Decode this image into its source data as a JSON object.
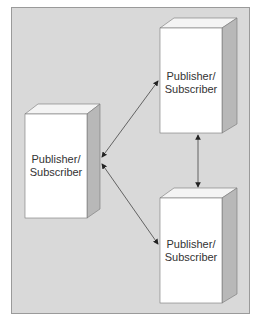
{
  "diagram": {
    "nodes": [
      {
        "id": "left",
        "label_line1": "Publisher/",
        "label_line2": "Subscriber"
      },
      {
        "id": "top-right",
        "label_line1": "Publisher/",
        "label_line2": "Subscriber"
      },
      {
        "id": "bottom-right",
        "label_line1": "Publisher/",
        "label_line2": "Subscriber"
      }
    ],
    "edges": [
      {
        "from": "left",
        "to": "top-right",
        "type": "bidirectional"
      },
      {
        "from": "left",
        "to": "bottom-right",
        "type": "bidirectional"
      },
      {
        "from": "top-right",
        "to": "bottom-right",
        "type": "bidirectional"
      }
    ],
    "colors": {
      "background": "#d9d9d9",
      "box_front": "#ffffff",
      "box_side": "#b8b8b8",
      "box_top": "#f4f4f4",
      "line": "#333333"
    }
  }
}
